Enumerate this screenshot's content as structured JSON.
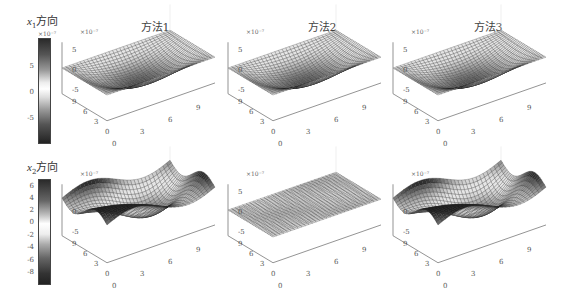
{
  "rows": [
    {
      "label_var": "x",
      "label_sub": "1",
      "label_text": "方向",
      "colorbar": {
        "multiplier": "×10⁻⁷",
        "ticks": [
          "5",
          "0",
          "-5"
        ],
        "range": [
          -9,
          9
        ]
      }
    },
    {
      "label_var": "x",
      "label_sub": "2",
      "label_text": "方向",
      "colorbar": {
        "multiplier": "",
        "ticks": [
          "6",
          "4",
          "2",
          "0",
          "-2",
          "-4",
          "-6",
          "-8"
        ],
        "range": [
          -9,
          7
        ]
      }
    }
  ],
  "columns": [
    {
      "title": "方法1"
    },
    {
      "title": "方法2"
    },
    {
      "title": "方法3"
    }
  ],
  "axes": {
    "z_multiplier": "×10⁻⁷",
    "z_ticks": [
      "5",
      "0",
      "-5"
    ],
    "x_ticks": [
      "0",
      "3",
      "6",
      "9"
    ],
    "y_ticks": [
      "0",
      "3",
      "6",
      "9"
    ]
  },
  "chart_data": [
    {
      "type": "surface",
      "title": "方法1",
      "row": "x1方向",
      "x": [
        0,
        9
      ],
      "y": [
        0,
        9
      ],
      "zlabel_multiplier": "×10⁻⁷",
      "zlim": [
        -9,
        9
      ],
      "shape": "saddle-like: peaks at two back corners ~7, trough at front ~-9",
      "colormap": "gray"
    },
    {
      "type": "surface",
      "title": "方法2",
      "row": "x1方向",
      "x": [
        0,
        9
      ],
      "y": [
        0,
        9
      ],
      "zlabel_multiplier": "×10⁻⁷",
      "zlim": [
        -9,
        9
      ],
      "shape": "saddle-like: peaks at two back corners ~7, trough at front ~-9",
      "colormap": "gray"
    },
    {
      "type": "surface",
      "title": "方法3",
      "row": "x1方向",
      "x": [
        0,
        9
      ],
      "y": [
        0,
        9
      ],
      "zlabel_multiplier": "×10⁻⁷",
      "zlim": [
        -9,
        9
      ],
      "shape": "saddle-like: peaks at two back corners ~7, trough at front ~-9",
      "colormap": "gray"
    },
    {
      "type": "surface",
      "title": "方法1",
      "row": "x2方向",
      "x": [
        0,
        9
      ],
      "y": [
        0,
        9
      ],
      "zlabel_multiplier": "×10⁻⁷",
      "zlim": [
        -9,
        7
      ],
      "shape": "large amplitude: peak at back-left ~7, trough at front ~-9",
      "colormap": "gray"
    },
    {
      "type": "surface",
      "title": "方法2",
      "row": "x2方向",
      "x": [
        0,
        9
      ],
      "y": [
        0,
        9
      ],
      "zlabel_multiplier": "×10⁻⁷",
      "zlim": [
        -2,
        2
      ],
      "shape": "nearly flat, small ripples",
      "colormap": "gray"
    },
    {
      "type": "surface",
      "title": "方法3",
      "row": "x2方向",
      "x": [
        0,
        9
      ],
      "y": [
        0,
        9
      ],
      "zlabel_multiplier": "×10⁻⁷",
      "zlim": [
        -9,
        7
      ],
      "shape": "large amplitude: peak at back-left ~7, trough at front ~-9",
      "colormap": "gray"
    }
  ]
}
